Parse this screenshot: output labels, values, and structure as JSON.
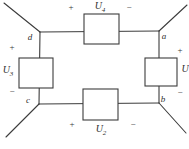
{
  "circuit": {
    "description": "Four-element voltage loop diagram",
    "background_color": "#ffffff",
    "line_color": "#3c3c3c",
    "signs": {
      "plus": "+",
      "minus": "−"
    },
    "elements": {
      "u4": {
        "base": "U",
        "sub": "4",
        "position": "top",
        "plus_side": "left",
        "minus_side": "right"
      },
      "u3": {
        "base": "U",
        "sub": "3",
        "position": "left",
        "plus_side": "top",
        "minus_side": "bottom"
      },
      "u1": {
        "base": "U",
        "sub": "",
        "position": "right",
        "plus_side": "top",
        "minus_side": "bottom"
      },
      "u2": {
        "base": "U",
        "sub": "2",
        "position": "bottom",
        "plus_side": "left",
        "minus_side": "right"
      }
    },
    "nodes": {
      "d": "d",
      "a": "a",
      "c": "c",
      "b": "b"
    }
  }
}
